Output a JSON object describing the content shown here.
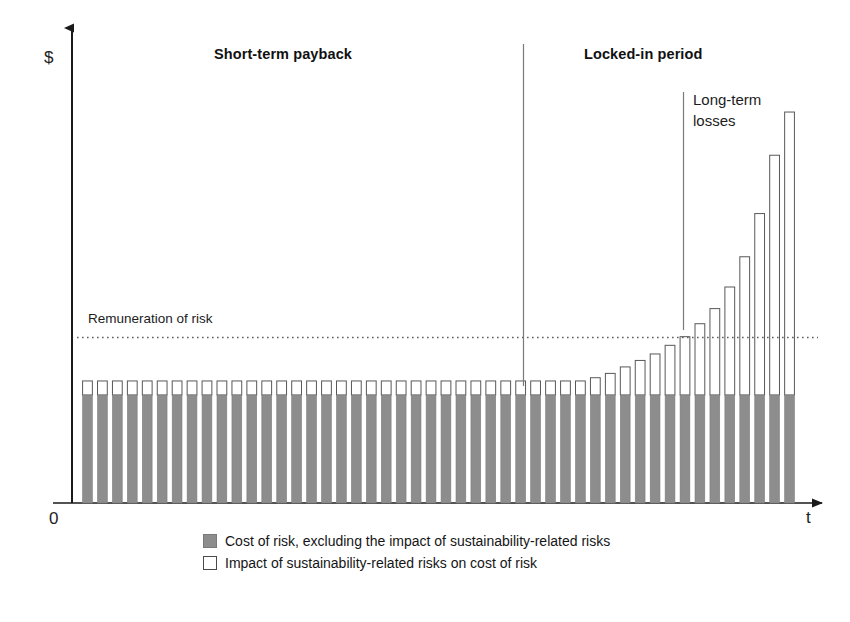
{
  "chart_data": {
    "type": "bar",
    "title": "",
    "subtitle": "",
    "xlabel": "t",
    "ylabel": "$",
    "origin_label": "0",
    "grid": false,
    "stacked": true,
    "legend_position": "bottom",
    "series": [
      {
        "name": "Cost of risk, excluding the impact of sustainability-related risks",
        "color": "#8d8d8d",
        "style": "filled",
        "values": [
          100,
          100,
          100,
          100,
          100,
          100,
          100,
          100,
          100,
          100,
          100,
          100,
          100,
          100,
          100,
          100,
          100,
          100,
          100,
          100,
          100,
          100,
          100,
          100,
          100,
          100,
          100,
          100,
          100,
          100,
          100,
          100,
          100,
          100,
          100,
          100,
          100,
          100,
          100,
          100,
          100,
          100,
          100,
          100,
          100,
          100,
          100,
          100
        ]
      },
      {
        "name": "Impact of sustainability-related risks on cost of risk",
        "color": "#ffffff",
        "style": "hollow",
        "values": [
          13,
          13,
          13,
          13,
          13,
          13,
          13,
          13,
          13,
          13,
          13,
          13,
          13,
          13,
          13,
          13,
          13,
          13,
          13,
          13,
          13,
          13,
          13,
          13,
          13,
          13,
          13,
          13,
          13,
          13,
          13,
          13,
          13,
          13,
          16,
          20,
          26,
          32,
          38,
          46,
          54,
          66,
          80,
          100,
          128,
          168,
          222,
          262
        ]
      }
    ],
    "annotations": [
      {
        "name": "remuneration-threshold",
        "label": "Remuneration of risk",
        "type": "horizontal-dashed-line",
        "value": 154
      },
      {
        "name": "period-divider",
        "type": "vertical-line",
        "at_bar_index": 34
      },
      {
        "name": "long-term-losses-marker",
        "type": "vertical-line",
        "at_bar_index": 42
      }
    ],
    "axis_ranges": {
      "y": [
        0,
        400
      ],
      "x": [
        0,
        48
      ]
    }
  },
  "labels": {
    "y_axis": "$",
    "x_axis": "t",
    "origin": "0",
    "section_left": "Short-term payback",
    "section_right": "Locked-in period",
    "callout_line1": "Long-term",
    "callout_line2": "losses",
    "threshold": "Remuneration of risk"
  },
  "legend": {
    "items": [
      {
        "swatch": "filled-gray-square",
        "label": "Cost of risk, excluding the impact of sustainability-related risks"
      },
      {
        "swatch": "hollow-white-square",
        "label": "Impact of sustainability-related risks on cost of risk"
      }
    ]
  },
  "colors": {
    "bar_fill": "#8d8d8d",
    "bar_fill_stroke": "#7d7d7d",
    "bar_hollow": "#ffffff",
    "bar_hollow_stroke": "#585858",
    "axis": "#1a1a1a",
    "divider": "#6b6b6b",
    "dashed": "#6b6b6b",
    "background": "#ffffff"
  }
}
